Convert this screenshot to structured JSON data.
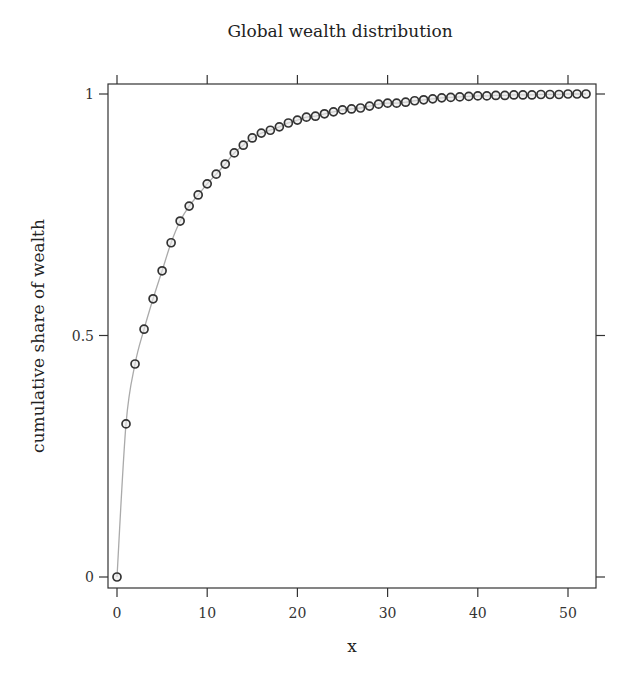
{
  "chart_data": {
    "type": "line",
    "title": "Global wealth distribution",
    "xlabel": "x",
    "ylabel": "cumulative share of wealth",
    "xlim": [
      -1.0,
      53.0
    ],
    "ylim": [
      -0.023,
      1.02
    ],
    "xticks": [
      0,
      10,
      20,
      30,
      40,
      50
    ],
    "xtick_labels": [
      "0",
      "10",
      "20",
      "30",
      "40",
      "50"
    ],
    "yticks": [
      0,
      0.5,
      1
    ],
    "ytick_labels": [
      "0",
      "0.5",
      "1"
    ],
    "grid": false,
    "legend": null,
    "markers": "open circles",
    "series": [
      {
        "name": "cumulative share of wealth",
        "x": [
          0,
          1,
          2,
          3,
          4,
          5,
          6,
          7,
          8,
          9,
          10,
          11,
          12,
          13,
          14,
          15,
          16,
          17,
          18,
          19,
          20,
          21,
          22,
          23,
          24,
          25,
          26,
          27,
          28,
          29,
          30,
          31,
          32,
          33,
          34,
          35,
          36,
          37,
          38,
          39,
          40,
          41,
          42,
          43,
          44,
          45,
          46,
          47,
          48,
          49,
          50,
          51,
          52
        ],
        "values": [
          0.0,
          0.317,
          0.441,
          0.513,
          0.576,
          0.634,
          0.692,
          0.737,
          0.768,
          0.791,
          0.814,
          0.834,
          0.855,
          0.878,
          0.894,
          0.909,
          0.919,
          0.925,
          0.932,
          0.94,
          0.946,
          0.952,
          0.954,
          0.959,
          0.963,
          0.967,
          0.969,
          0.971,
          0.975,
          0.979,
          0.981,
          0.981,
          0.983,
          0.986,
          0.988,
          0.99,
          0.992,
          0.993,
          0.994,
          0.995,
          0.996,
          0.996,
          0.997,
          0.997,
          0.998,
          0.998,
          0.998,
          0.999,
          0.999,
          0.999,
          1.0,
          1.0,
          1.0
        ]
      }
    ]
  },
  "colors": {
    "frame": "#333333",
    "line": "#aaaaaa",
    "marker": "#333333",
    "text": "#222222"
  }
}
